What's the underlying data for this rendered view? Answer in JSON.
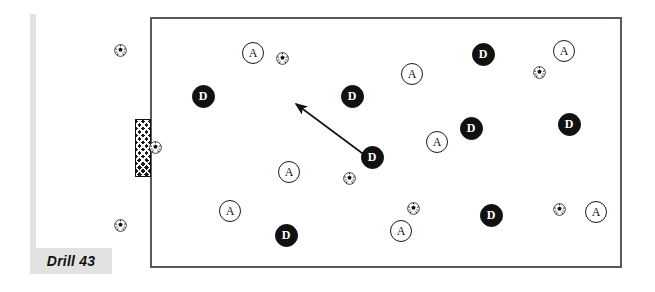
{
  "diagram": {
    "title_label": "Drill 43",
    "type": "soccer-drill",
    "field": {
      "shape": "rectangle",
      "border_color": "#555a5c",
      "fill_color": "#ffffff",
      "x": 150,
      "y": 17,
      "width": 472,
      "height": 251
    },
    "goal": {
      "name": "goal-net",
      "pattern": "crosshatch",
      "color": "#1c1c1c",
      "x": 135,
      "y": 119,
      "width": 16,
      "height": 58
    },
    "accent_color": "#e2e2e2",
    "legend": {
      "attacker_letter": "A",
      "defender_letter": "D"
    }
  },
  "players": [
    {
      "label": "A",
      "role": "attacker",
      "x": 253,
      "y": 53
    },
    {
      "label": "D",
      "role": "defender",
      "x": 203,
      "y": 96
    },
    {
      "label": "A",
      "role": "attacker",
      "x": 412,
      "y": 74
    },
    {
      "label": "D",
      "role": "defender",
      "x": 352,
      "y": 96
    },
    {
      "label": "D",
      "role": "defender",
      "x": 483,
      "y": 54
    },
    {
      "label": "A",
      "role": "attacker",
      "x": 564,
      "y": 51
    },
    {
      "label": "D",
      "role": "defender",
      "x": 471,
      "y": 128
    },
    {
      "label": "D",
      "role": "defender",
      "x": 569,
      "y": 124
    },
    {
      "label": "A",
      "role": "attacker",
      "x": 437,
      "y": 142
    },
    {
      "label": "D",
      "role": "defender",
      "x": 372,
      "y": 157
    },
    {
      "label": "A",
      "role": "attacker",
      "x": 289,
      "y": 172
    },
    {
      "label": "A",
      "role": "attacker",
      "x": 230,
      "y": 211
    },
    {
      "label": "D",
      "role": "defender",
      "x": 286,
      "y": 235
    },
    {
      "label": "A",
      "role": "attacker",
      "x": 401,
      "y": 231
    },
    {
      "label": "D",
      "role": "defender",
      "x": 491,
      "y": 215
    },
    {
      "label": "A",
      "role": "attacker",
      "x": 596,
      "y": 212
    }
  ],
  "balls": [
    {
      "x": 120,
      "y": 50,
      "location": "outside-left-top"
    },
    {
      "x": 120,
      "y": 225,
      "location": "outside-left-bottom"
    },
    {
      "x": 155,
      "y": 147,
      "location": "at-goal"
    },
    {
      "x": 282,
      "y": 58,
      "location": "in-field"
    },
    {
      "x": 539,
      "y": 72,
      "location": "in-field"
    },
    {
      "x": 349,
      "y": 178,
      "location": "in-field"
    },
    {
      "x": 413,
      "y": 208,
      "location": "in-field"
    },
    {
      "x": 559,
      "y": 209,
      "location": "in-field"
    }
  ],
  "arrow": {
    "name": "movement-arrow",
    "from_x": 366,
    "from_y": 156,
    "to_x": 296,
    "to_y": 104,
    "color": "#111111"
  }
}
